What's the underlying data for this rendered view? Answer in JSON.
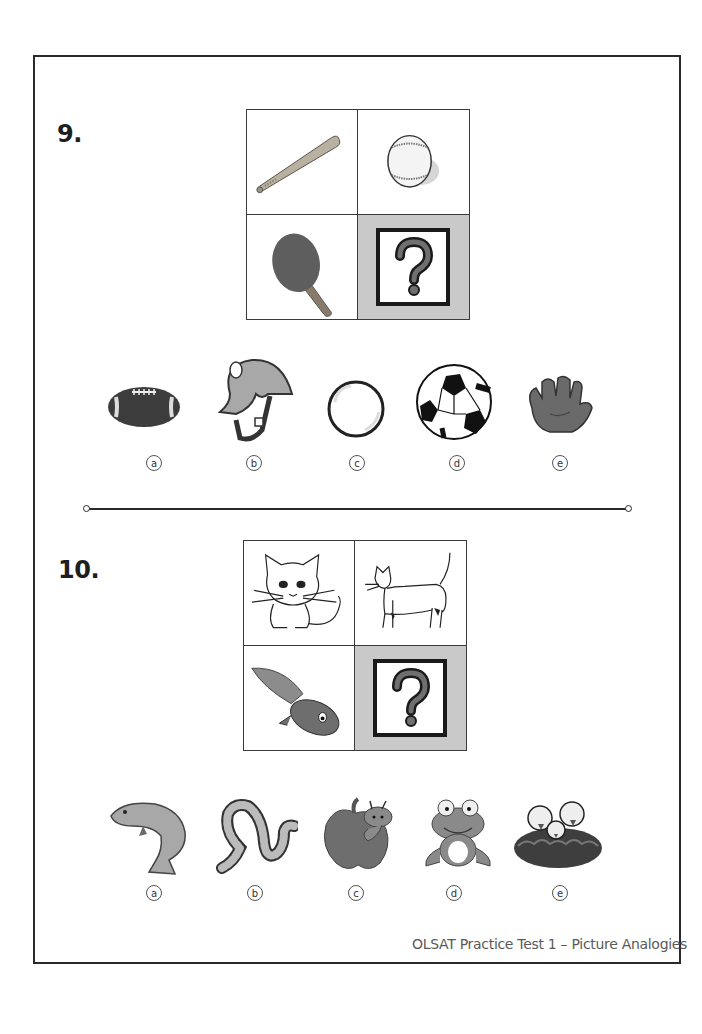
{
  "document": {
    "footer": "OLSAT Practice Test 1  – Picture Analogies",
    "colors": {
      "frame": "#2a2a2a",
      "unknown_cell_bg": "#c9c9c9",
      "text": "#1e1e1e"
    }
  },
  "questions": [
    {
      "number": "9.",
      "grid": {
        "top_left": "baseball-bat-icon",
        "top_right": "baseball-icon",
        "bottom_left": "ping-pong-paddle-icon",
        "bottom_right": "question-mark-icon"
      },
      "options": [
        {
          "letter": "a",
          "icon": "football-icon"
        },
        {
          "letter": "b",
          "icon": "helmet-icon"
        },
        {
          "letter": "c",
          "icon": "ping-pong-ball-icon"
        },
        {
          "letter": "d",
          "icon": "soccer-ball-icon"
        },
        {
          "letter": "e",
          "icon": "baseball-glove-icon"
        }
      ]
    },
    {
      "number": "10.",
      "grid": {
        "top_left": "kitten-icon",
        "top_right": "cat-icon",
        "bottom_left": "tadpole-icon",
        "bottom_right": "question-mark-icon"
      },
      "options": [
        {
          "letter": "a",
          "icon": "fish-icon"
        },
        {
          "letter": "b",
          "icon": "snake-icon"
        },
        {
          "letter": "c",
          "icon": "apple-worm-icon"
        },
        {
          "letter": "d",
          "icon": "frog-icon"
        },
        {
          "letter": "e",
          "icon": "bird-nest-icon"
        }
      ]
    }
  ]
}
